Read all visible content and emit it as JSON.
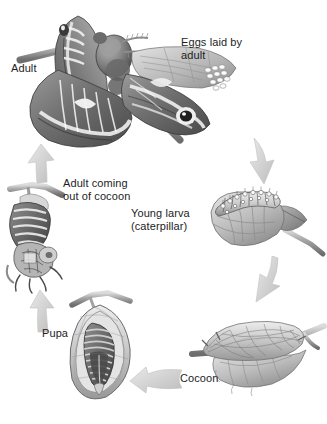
{
  "diagram": {
    "style": "grayscale pencil illustration",
    "background_color": "#ffffff",
    "text_color": "#1d1d1d",
    "arrow_color": "#c9c9c9"
  },
  "labels": {
    "adult": "Adult",
    "eggs": "Eggs laid by\nadult",
    "adult_coming": "Adult coming\nout of cocoon",
    "young_larva": "Young larva\n(caterpillar)",
    "pupa": "Pupa",
    "cocoon": "Cocoon"
  },
  "stages": [
    {
      "id": "adult",
      "label": "Adult",
      "description": "Large adult cecropia moth with patterned wings perched on a twig"
    },
    {
      "id": "eggs",
      "label": "Eggs laid by adult",
      "description": "Cluster of small pale oval eggs on the moth's hind wing"
    },
    {
      "id": "young-larva",
      "label": "Young larva (caterpillar)",
      "description": "Spiny caterpillar feeding along the edge of a leaf"
    },
    {
      "id": "cocoon",
      "label": "Cocoon",
      "description": "Silken cocoon spun along a twig and wrapped with a leaf"
    },
    {
      "id": "pupa",
      "label": "Pupa",
      "description": "Cutaway cocoon showing the pupa inside hanging from a twig"
    },
    {
      "id": "adult-coming",
      "label": "Adult coming out of cocoon",
      "description": "Moth emerging from the opened cocoon on a twig"
    }
  ],
  "arrows": [
    {
      "id": "eggs-to-larva",
      "from": "eggs",
      "to": "young-larva",
      "direction": "down"
    },
    {
      "id": "larva-to-cocoon",
      "from": "young-larva",
      "to": "cocoon",
      "direction": "down-left"
    },
    {
      "id": "cocoon-to-pupa",
      "from": "cocoon",
      "to": "pupa",
      "direction": "left"
    },
    {
      "id": "pupa-to-adult-coming",
      "from": "pupa",
      "to": "adult-coming",
      "direction": "up"
    },
    {
      "id": "adult-coming-to-adult",
      "from": "adult-coming",
      "to": "adult",
      "direction": "up"
    }
  ]
}
